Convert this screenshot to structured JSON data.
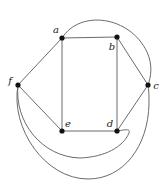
{
  "figure": {
    "width": 164,
    "height": 191,
    "background_color": "#ffffff",
    "stroke_color": "#6b6b6b",
    "vertex_color": "#111111",
    "label_color": "#1a1a1a"
  },
  "graph_data": {
    "type": "graph",
    "vertices": [
      {
        "id": "a",
        "label": "a",
        "x": 62,
        "y": 38,
        "label_x": 56,
        "label_y": 30
      },
      {
        "id": "b",
        "label": "b",
        "x": 117,
        "y": 37,
        "label_x": 112,
        "label_y": 47
      },
      {
        "id": "c",
        "label": "c",
        "x": 148,
        "y": 85,
        "label_x": 156,
        "label_y": 86
      },
      {
        "id": "d",
        "label": "d",
        "x": 117,
        "y": 131,
        "label_x": 110,
        "label_y": 124
      },
      {
        "id": "e",
        "label": "e",
        "x": 62,
        "y": 131,
        "label_x": 68,
        "label_y": 124
      },
      {
        "id": "f",
        "label": "f",
        "x": 18,
        "y": 85,
        "label_x": 10,
        "label_y": 81
      }
    ],
    "straight_edges": [
      {
        "from": "a",
        "to": "b"
      },
      {
        "from": "b",
        "to": "c"
      },
      {
        "from": "c",
        "to": "d"
      },
      {
        "from": "d",
        "to": "e"
      },
      {
        "from": "e",
        "to": "f"
      },
      {
        "from": "f",
        "to": "a"
      },
      {
        "from": "a",
        "to": "e"
      },
      {
        "from": "b",
        "to": "d"
      }
    ],
    "curved_edges": [
      {
        "from": "a",
        "to": "c",
        "path": "M 62 38 C 80 9 130 16 147 52 C 153 65 151 77 148 85",
        "description": "arc over the top from a to c"
      },
      {
        "from": "f",
        "to": "d",
        "path": "M 18 85 C 14 122 42 157 80 158 C 105 157 123 147 129 133 C 131 128 124 130 117 131",
        "description": "inner lower arc from f to d"
      },
      {
        "from": "f",
        "to": "c",
        "path": "M 18 85 C 10 128 45 179 88 179 C 124 179 148 146 149 104 C 149 96 149 90 148 85",
        "description": "outer lower arc from f to c"
      }
    ],
    "vertex_radius": 2.6
  }
}
